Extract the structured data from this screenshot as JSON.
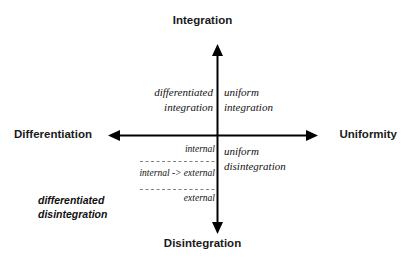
{
  "diagram": {
    "background_color": "#ffffff",
    "axis_color": "#000000",
    "dashed_line_color": "#777777",
    "axes": {
      "vertical": {
        "top_label": "Integration",
        "bottom_label": "Disintegration"
      },
      "horizontal": {
        "left_label": "Differentiation",
        "right_label": "Uniformity"
      }
    },
    "quadrants": {
      "top_left": {
        "line1": "differentiated",
        "line2": "integration"
      },
      "top_right": {
        "line1": "uniform",
        "line2": "integration"
      },
      "bottom_right": {
        "line1": "uniform",
        "line2": "disintegration"
      },
      "bottom_left": {
        "line1": "differentiated",
        "line2": "disintegration"
      }
    },
    "bands": {
      "internal": "internal",
      "internal_to_external": "internal -> external",
      "external": "external"
    }
  }
}
